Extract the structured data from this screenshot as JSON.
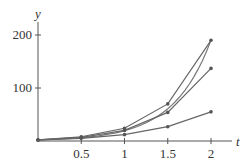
{
  "chart_data": {
    "type": "line",
    "title": "",
    "xlabel": "t",
    "ylabel": "y",
    "xlim": [
      0,
      2.2
    ],
    "ylim": [
      0,
      220
    ],
    "grid": false,
    "x_ticks": [
      0.5,
      1,
      1.5,
      2
    ],
    "x_tick_labels": [
      "0.5",
      "1",
      "1.5",
      "2"
    ],
    "y_ticks": [
      100,
      200
    ],
    "y_tick_labels": [
      "100",
      "200"
    ],
    "x": [
      0,
      0.5,
      1,
      1.5,
      2
    ],
    "series": [
      {
        "name": "exact",
        "style": "smooth",
        "values": [
          2,
          8,
          25,
          68,
          190
        ]
      },
      {
        "name": "approx-1",
        "values": [
          2,
          8,
          24,
          70,
          190
        ]
      },
      {
        "name": "approx-2",
        "values": [
          2,
          7,
          20,
          54,
          137
        ]
      },
      {
        "name": "approx-3",
        "values": [
          2,
          5,
          12,
          27,
          55
        ]
      }
    ]
  }
}
